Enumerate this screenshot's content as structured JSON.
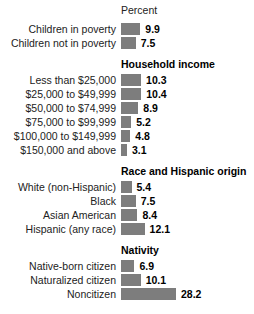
{
  "axis_title": "Percent",
  "chart_data": {
    "type": "bar",
    "orientation": "horizontal",
    "title": "",
    "subtitle": "",
    "xlabel": "Percent",
    "ylabel": "",
    "xlim": [
      0,
      30
    ],
    "grid": false,
    "legend": "none",
    "value_labels": true,
    "bar_color": "#7d7d7d",
    "axis_title": "Percent",
    "categories": [
      "Children in poverty",
      "Children not in poverty",
      "Less than $25,000",
      "$25,000 to $49,999",
      "$50,000 to $74,999",
      "$75,000 to $99,999",
      "$100,000 to $149,999",
      "$150,000 and above",
      "White (non-Hispanic)",
      "Black",
      "Asian American",
      "Hispanic (any race)",
      "Native-born citizen",
      "Naturalized citizen",
      "Noncitizen"
    ],
    "values": [
      9.9,
      7.5,
      10.3,
      10.4,
      8.9,
      5.2,
      4.8,
      3.1,
      5.4,
      7.5,
      8.4,
      12.1,
      6.9,
      10.1,
      28.2
    ],
    "groups": [
      {
        "title": "",
        "rows": [
          {
            "label": "Children in poverty",
            "value": 9.9,
            "value_text": "9.9"
          },
          {
            "label": "Children not in poverty",
            "value": 7.5,
            "value_text": "7.5"
          }
        ]
      },
      {
        "title": "Household income",
        "rows": [
          {
            "label": "Less than $25,000",
            "value": 10.3,
            "value_text": "10.3"
          },
          {
            "label": "$25,000 to $49,999",
            "value": 10.4,
            "value_text": "10.4"
          },
          {
            "label": "$50,000 to $74,999",
            "value": 8.9,
            "value_text": "8.9"
          },
          {
            "label": "$75,000 to $99,999",
            "value": 5.2,
            "value_text": "5.2"
          },
          {
            "label": "$100,000 to $149,999",
            "value": 4.8,
            "value_text": "4.8"
          },
          {
            "label": "$150,000 and above",
            "value": 3.1,
            "value_text": "3.1"
          }
        ]
      },
      {
        "title": "Race and Hispanic origin",
        "rows": [
          {
            "label": "White (non-Hispanic)",
            "value": 5.4,
            "value_text": "5.4"
          },
          {
            "label": "Black",
            "value": 7.5,
            "value_text": "7.5"
          },
          {
            "label": "Asian American",
            "value": 8.4,
            "value_text": "8.4"
          },
          {
            "label": "Hispanic (any race)",
            "value": 12.1,
            "value_text": "12.1"
          }
        ]
      },
      {
        "title": "Nativity",
        "rows": [
          {
            "label": "Native-born citizen",
            "value": 6.9,
            "value_text": "6.9"
          },
          {
            "label": "Naturalized citizen",
            "value": 10.1,
            "value_text": "10.1"
          },
          {
            "label": "Noncitizen",
            "value": 28.2,
            "value_text": "28.2"
          }
        ]
      }
    ]
  }
}
